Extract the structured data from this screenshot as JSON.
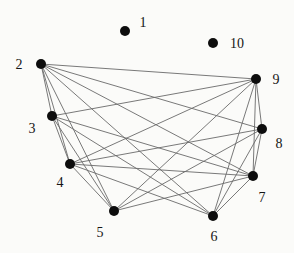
{
  "figure": {
    "width": 294,
    "height": 253,
    "background": "#fbfbf9",
    "edge_color": "#6a6a6a",
    "edge_width": 0.9,
    "node_color": "#0d0d0d",
    "node_radius": 5,
    "label_color": "#151515",
    "label_font_size": 14
  },
  "chart_data": {
    "type": "network-graph",
    "title": "",
    "nodes": [
      {
        "id": "1",
        "x": 125,
        "y": 31,
        "label": "1",
        "label_x": 143,
        "label_y": 27
      },
      {
        "id": "2",
        "x": 41,
        "y": 64,
        "label": "2",
        "label_x": 19,
        "label_y": 69
      },
      {
        "id": "3",
        "x": 52,
        "y": 116,
        "label": "3",
        "label_x": 32,
        "label_y": 133
      },
      {
        "id": "4",
        "x": 70,
        "y": 164,
        "label": "4",
        "label_x": 60,
        "label_y": 187
      },
      {
        "id": "5",
        "x": 114,
        "y": 211,
        "label": "5",
        "label_x": 100,
        "label_y": 237
      },
      {
        "id": "6",
        "x": 213,
        "y": 216,
        "label": "6",
        "label_x": 214,
        "label_y": 241
      },
      {
        "id": "7",
        "x": 253,
        "y": 176,
        "label": "7",
        "label_x": 262,
        "label_y": 202
      },
      {
        "id": "8",
        "x": 262,
        "y": 129,
        "label": "8",
        "label_x": 279,
        "label_y": 148
      },
      {
        "id": "9",
        "x": 256,
        "y": 79,
        "label": "9",
        "label_x": 276,
        "label_y": 84
      },
      {
        "id": "10",
        "x": 213,
        "y": 43,
        "label": "10",
        "label_x": 237,
        "label_y": 48
      }
    ],
    "edges": [
      [
        "2",
        "3"
      ],
      [
        "2",
        "4"
      ],
      [
        "2",
        "5"
      ],
      [
        "2",
        "6"
      ],
      [
        "2",
        "7"
      ],
      [
        "2",
        "8"
      ],
      [
        "2",
        "9"
      ],
      [
        "3",
        "4"
      ],
      [
        "3",
        "5"
      ],
      [
        "3",
        "6"
      ],
      [
        "3",
        "7"
      ],
      [
        "3",
        "9"
      ],
      [
        "4",
        "5"
      ],
      [
        "4",
        "6"
      ],
      [
        "4",
        "7"
      ],
      [
        "4",
        "8"
      ],
      [
        "4",
        "9"
      ],
      [
        "5",
        "7"
      ],
      [
        "5",
        "8"
      ],
      [
        "5",
        "9"
      ],
      [
        "6",
        "7"
      ],
      [
        "6",
        "8"
      ],
      [
        "6",
        "9"
      ],
      [
        "7",
        "8"
      ],
      [
        "7",
        "9"
      ],
      [
        "8",
        "9"
      ]
    ]
  }
}
